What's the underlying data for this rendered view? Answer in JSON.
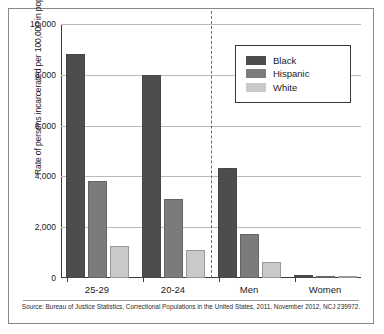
{
  "chart_data": {
    "type": "bar",
    "title": "",
    "xlabel": "",
    "ylabel": "Rate of persons incarcerated per 100,000 in population",
    "categories": [
      "25-29",
      "20-24",
      "Men",
      "Women"
    ],
    "series": [
      {
        "name": "Black",
        "color": "#4d4d4d",
        "values": [
          8800,
          8000,
          4350,
          130
        ]
      },
      {
        "name": "Hispanic",
        "color": "#7b7b7b",
        "values": [
          3800,
          3100,
          1750,
          70
        ]
      },
      {
        "name": "White",
        "color": "#c9c9c9",
        "values": [
          1250,
          1100,
          650,
          50
        ]
      }
    ],
    "ylim": [
      0,
      10000
    ],
    "yticks": [
      0,
      2000,
      4000,
      6000,
      8000,
      10000
    ],
    "ytick_labels": [
      "0",
      "2,000",
      "4,000",
      "6,000",
      "8,000",
      "10,000"
    ],
    "grid": true,
    "legend_position": "top-right",
    "annotations": {
      "divider": "dashed vertical line separating age groups from sex groups"
    },
    "source": "Source: Bureau of Justice Statistics, Correctional Populations in the United States, 2011, November 2012, NCJ 239972."
  }
}
